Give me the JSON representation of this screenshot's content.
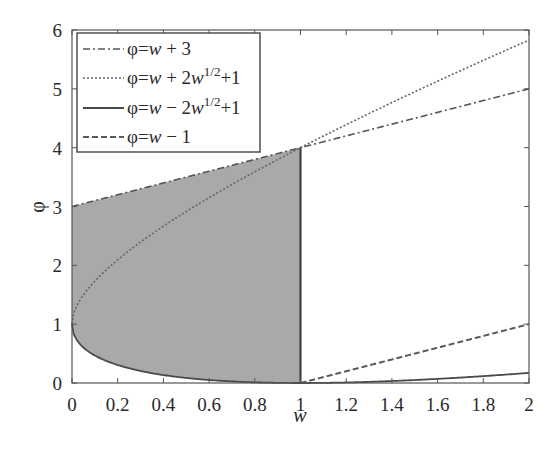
{
  "chart_data": {
    "type": "line",
    "title": "",
    "xlabel": "w",
    "ylabel": "φ",
    "xlim": [
      0,
      2
    ],
    "ylim": [
      0,
      6
    ],
    "x_ticks": [
      "0",
      "0.2",
      "0.4",
      "0.6",
      "0.8",
      "1",
      "1.2",
      "1.4",
      "1.6",
      "1.8",
      "2"
    ],
    "y_ticks": [
      "0",
      "1",
      "2",
      "3",
      "4",
      "5",
      "6"
    ],
    "grid": false,
    "legend_position": "upper left",
    "shaded_region": {
      "description": "region bounded by φ=w+3 (top), φ=w-2w^(1/2)+1 (bottom), w=0 to w=1",
      "color": "#a9a9a9"
    },
    "series": [
      {
        "name": "φ=w+3",
        "style": "dash-dot",
        "x": [
          0,
          1,
          2
        ],
        "values": [
          3,
          4,
          5
        ]
      },
      {
        "name": "φ=w+2w^1/2+1",
        "style": "dotted",
        "x": [
          0,
          0.25,
          0.5,
          1,
          1.5,
          2
        ],
        "values": [
          1,
          2.25,
          2.91,
          4,
          4.95,
          5.83
        ]
      },
      {
        "name": "φ=w−2w^1/2+1",
        "style": "solid",
        "x": [
          0,
          0.25,
          0.5,
          1,
          1.5,
          2
        ],
        "values": [
          1,
          0.25,
          0.09,
          0,
          0.05,
          0.17
        ]
      },
      {
        "name": "φ=w−1",
        "style": "dashed",
        "x": [
          1,
          2
        ],
        "values": [
          0,
          1
        ]
      }
    ]
  },
  "legend": {
    "items": [
      {
        "label_pre": "φ=",
        "var": "w",
        "label_post": " + 3",
        "sup": "",
        "tail": ""
      },
      {
        "label_pre": "φ=",
        "var": "w",
        "label_post": " + 2",
        "var2": "w",
        "sup": "1/2",
        "tail": "+1"
      },
      {
        "label_pre": "φ=",
        "var": "w",
        "label_post": " − 2",
        "var2": "w",
        "sup": "1/2",
        "tail": "+1"
      },
      {
        "label_pre": "φ=",
        "var": "w",
        "label_post": " − 1",
        "sup": "",
        "tail": ""
      }
    ]
  },
  "axes": {
    "xlabel": "w",
    "ylabel": "φ"
  }
}
